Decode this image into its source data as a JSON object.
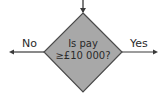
{
  "diagram": {
    "type": "flowchart-decision",
    "decision": {
      "line1": "Is pay",
      "line2": "≥£10 000?",
      "fill": "#a8a8a8",
      "stroke": "#4a4a4a"
    },
    "branches": {
      "left": {
        "label": "No"
      },
      "right": {
        "label": "Yes"
      }
    },
    "incoming": "top-arrow",
    "colors": {
      "line": "#3a3a3a",
      "text": "#2a2a2a",
      "background": "#ffffff"
    }
  }
}
